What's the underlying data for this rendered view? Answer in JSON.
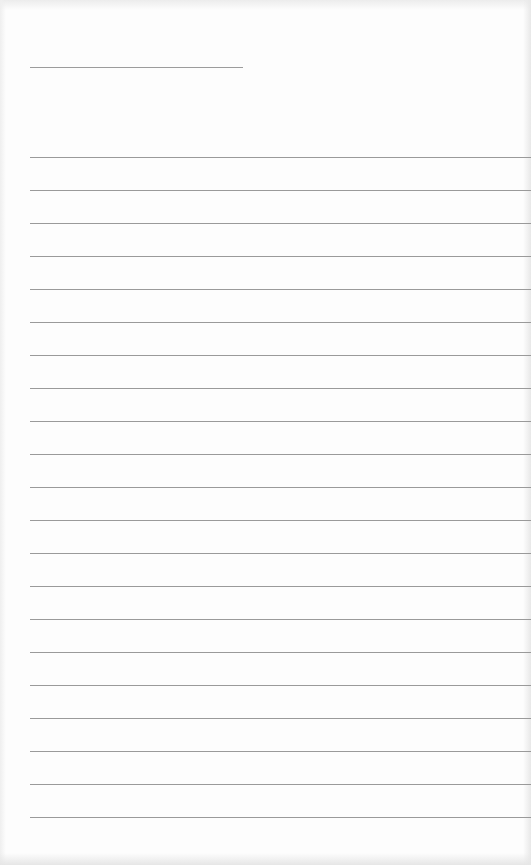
{
  "document": {
    "type": "blank-lined-form",
    "header": {
      "field_line": "",
      "field_line_visible": true
    },
    "ruled_lines": {
      "count": 21,
      "spacing_px": 33,
      "first_line_y": 157,
      "color": "#9a9a9a",
      "entries": [
        "",
        "",
        "",
        "",
        "",
        "",
        "",
        "",
        "",
        "",
        "",
        "",
        "",
        "",
        "",
        "",
        "",
        "",
        "",
        "",
        ""
      ]
    },
    "colors": {
      "paper": "#fdfdfd",
      "line": "#9a9a9a"
    }
  }
}
